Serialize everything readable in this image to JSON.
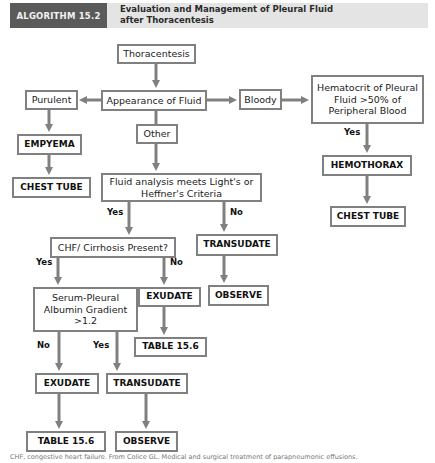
{
  "header": {
    "tag": "ALGORITHM 15.2",
    "title_line1": "Evaluation and Management of Pleural Fluid",
    "title_line2": "after Thoracentesis"
  },
  "nodes": {
    "thoracentesis": "Thoracentesis",
    "appearance": "Appearance of Fluid",
    "purulent": "Purulent",
    "bloody": "Bloody",
    "other": "Other",
    "hematocrit_l1": "Hematocrit of Pleural",
    "hematocrit_l2": "Fluid >50% of",
    "hematocrit_l3": "Peripheral Blood",
    "empyema": "EMPYEMA",
    "chest_tube_left": "CHEST TUBE",
    "hemothorax": "HEMOTHORAX",
    "chest_tube_right": "CHEST TUBE",
    "fluid_analysis_l1": "Fluid analysis meets Light's or",
    "fluid_analysis_l2": "Heffner's Criteria",
    "chf": "CHF/ Cirrhosis Present?",
    "transudate_right": "TRANSUDATE",
    "observe_right": "OBSERVE",
    "exudate_mid": "EXUDATE",
    "table_mid": "TABLE 15.6",
    "serum_l1": "Serum-Pleural",
    "serum_l2": "Albumin Gradient",
    "serum_l3": ">1.2",
    "exudate_bottom": "EXUDATE",
    "transudate_bottom": "TRANSUDATE",
    "table_bottom": "TABLE 15.6",
    "observe_bottom": "OBSERVE"
  },
  "edge_labels": {
    "hematocrit_yes": "Yes",
    "criteria_yes": "Yes",
    "criteria_no": "No",
    "chf_yes": "Yes",
    "chf_no": "No",
    "gradient_no": "No",
    "gradient_yes": "Yes"
  },
  "caption": "CHF, congestive heart failure. From Colice GL. Medical and surgical treatment of parapneumonic effusions."
}
